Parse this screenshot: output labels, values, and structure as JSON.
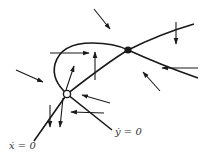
{
  "figure": {
    "type": "phase-plane",
    "colors": {
      "line": "#1a1a1a",
      "background": "#ffffff",
      "label": "#333333"
    },
    "labels": {
      "xdot_nullcline": "ẋ = 0",
      "ydot_nullcline": "ẏ = 0"
    },
    "fixed_points": [
      {
        "name": "unstable-node",
        "style": "open",
        "x": 67,
        "y": 94
      },
      {
        "name": "saddle",
        "style": "filled",
        "x": 128,
        "y": 50
      }
    ],
    "arrows": [
      {
        "x1": 94,
        "y1": 9,
        "x2": 110,
        "y2": 29
      },
      {
        "x1": 176,
        "y1": 22,
        "x2": 176,
        "y2": 44
      },
      {
        "x1": 198,
        "y1": 68,
        "x2": 162,
        "y2": 68
      },
      {
        "x1": 160,
        "y1": 91,
        "x2": 143,
        "y2": 72
      },
      {
        "x1": 50,
        "y1": 53,
        "x2": 89,
        "y2": 53
      },
      {
        "x1": 95,
        "y1": 80,
        "x2": 95,
        "y2": 52
      },
      {
        "x1": 66,
        "y1": 90,
        "x2": 74,
        "y2": 66
      },
      {
        "x1": 16,
        "y1": 70,
        "x2": 43,
        "y2": 82
      },
      {
        "x1": 110,
        "y1": 103,
        "x2": 82,
        "y2": 95
      },
      {
        "x1": 104,
        "y1": 113,
        "x2": 71,
        "y2": 112
      },
      {
        "x1": 50,
        "y1": 105,
        "x2": 50,
        "y2": 127
      },
      {
        "x1": 63,
        "y1": 98,
        "x2": 60,
        "y2": 127
      }
    ]
  }
}
